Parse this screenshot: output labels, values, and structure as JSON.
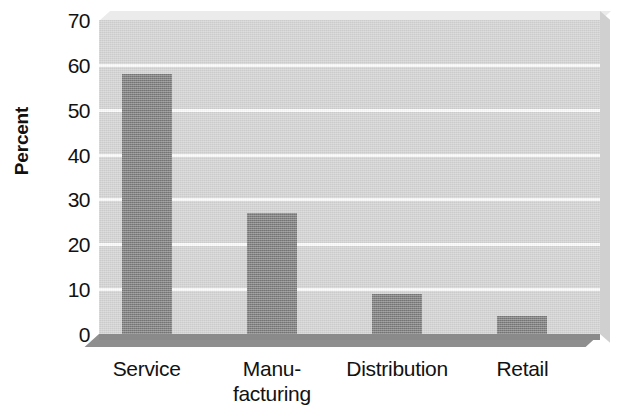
{
  "chart_data": {
    "type": "bar",
    "title": "",
    "subtitle": "",
    "xlabel": "",
    "ylabel": "Percent",
    "categories": [
      "Service",
      "Manufacturing",
      "Distribution",
      "Retail"
    ],
    "category_label_lines": [
      [
        "Service"
      ],
      [
        "Manu-",
        "facturing"
      ],
      [
        "Distribution"
      ],
      [
        "Retail"
      ]
    ],
    "values": [
      58,
      27,
      9,
      4
    ],
    "ylim": [
      0,
      70
    ],
    "yticks": [
      0,
      10,
      20,
      30,
      40,
      50,
      60,
      70
    ],
    "ytick_labels": [
      "0",
      "10",
      "20",
      "30",
      "40",
      "50",
      "60",
      "70"
    ],
    "grid": true,
    "grid_axis": "y",
    "legend": false,
    "legend_position": "none",
    "style": "3d-perspective-grayscale",
    "colors": {
      "bar": "#7e7e7e",
      "plot_background": "#d3d3d3",
      "gridline": "#fbfbfb",
      "floor": "#8a8a8a",
      "side_wall": "#d0d0d0",
      "top_wall": "#ebebeb",
      "text": "#121212",
      "page_background": "#ffffff"
    }
  }
}
